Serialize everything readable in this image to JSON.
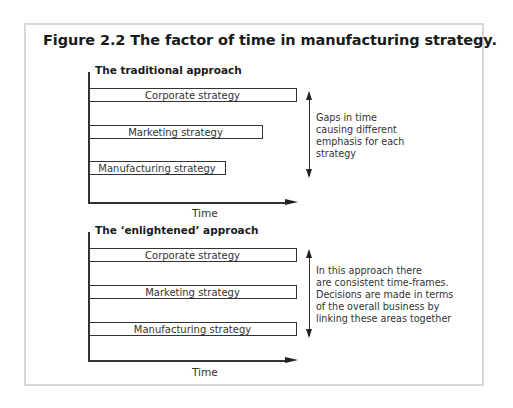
{
  "figure": {
    "title": "Figure 2.2  The factor of time in manufacturing strategy."
  },
  "traditional": {
    "title": "The traditional approach",
    "bars": [
      {
        "label": "Corporate strategy",
        "relative_length": 1.0
      },
      {
        "label": "Marketing strategy",
        "relative_length": 0.84
      },
      {
        "label": "Manufacturing strategy",
        "relative_length": 0.66
      }
    ],
    "axis_label": "Time",
    "note_lines": [
      "Gaps in time",
      "causing different",
      "emphasis for each",
      "strategy"
    ]
  },
  "enlightened": {
    "title": "The ‘enlightened’ approach",
    "bars": [
      {
        "label": "Corporate strategy",
        "relative_length": 1.0
      },
      {
        "label": "Marketing strategy",
        "relative_length": 1.0
      },
      {
        "label": "Manufacturing strategy",
        "relative_length": 1.0
      }
    ],
    "axis_label": "Time",
    "note_lines": [
      "In this approach there",
      "are consistent time-frames.",
      "Decisions are made in terms",
      "of the overall business by",
      "linking these areas together"
    ]
  }
}
